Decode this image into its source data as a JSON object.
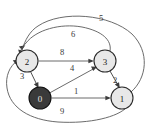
{
  "graph": {
    "type": "directed-weighted-graph",
    "background_color": "#ffffff",
    "edge_color": "#5a5a5a",
    "node_fill": "#e8e8e8",
    "node_start_fill": "#3a3a3a",
    "node_stroke": "#2b2b2b",
    "nodes": [
      {
        "id": "n0",
        "label": "0",
        "x": 40,
        "y": 98,
        "r": 11,
        "style": "filled-dark"
      },
      {
        "id": "n1",
        "label": "1",
        "x": 122,
        "y": 98,
        "r": 11,
        "style": "light"
      },
      {
        "id": "n2",
        "label": "2",
        "x": 27,
        "y": 61,
        "r": 11,
        "style": "light"
      },
      {
        "id": "n3",
        "label": "3",
        "x": 105,
        "y": 61,
        "r": 11,
        "style": "light"
      }
    ],
    "edges": [
      {
        "from": "1",
        "to": "2",
        "weight": "5",
        "lx": 101,
        "ly": 18
      },
      {
        "from": "3",
        "to": "2",
        "weight": "6",
        "lx": 73,
        "ly": 34
      },
      {
        "from": "2",
        "to": "3",
        "weight": "8",
        "lx": 62,
        "ly": 52
      },
      {
        "from": "0",
        "to": "3",
        "weight": "4",
        "lx": 72,
        "ly": 68
      },
      {
        "from": "2",
        "to": "0",
        "weight": "3",
        "lx": 22,
        "ly": 76
      },
      {
        "from": "3",
        "to": "1",
        "weight": "2",
        "lx": 115,
        "ly": 80
      },
      {
        "from": "0",
        "to": "1",
        "weight": "1",
        "lx": 76,
        "ly": 91
      },
      {
        "from": "1",
        "to": "2",
        "weight": "9",
        "lx": 62,
        "ly": 111
      }
    ]
  }
}
